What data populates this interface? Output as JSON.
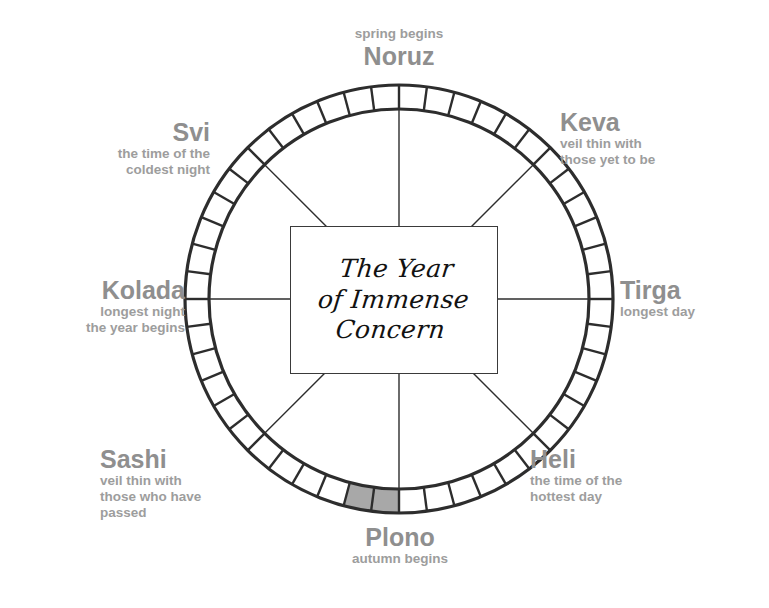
{
  "center": {
    "title": "The Year\nof Immense\nConcern"
  },
  "wheel": {
    "cell_count": 48,
    "spoke_count": 8,
    "highlighted_cells": [
      24,
      25
    ],
    "colors": {
      "line": "#2d2d2d",
      "highlight": "#a8a8a8",
      "cell_fill": "#ffffff",
      "background": "#ffffff"
    },
    "geometry": {
      "center_x": 399,
      "center_y": 299,
      "outer_radius": 214,
      "inner_radius": 190
    }
  },
  "stations": [
    {
      "id": "noruz",
      "name": "Noruz",
      "description": "spring begins",
      "position": "top",
      "align": "center",
      "order": "desc-first"
    },
    {
      "id": "keva",
      "name": "Keva",
      "description": "veil thin with\nthose yet to be",
      "position": "upper-right",
      "align": "left",
      "order": "name-first"
    },
    {
      "id": "tirga",
      "name": "Tirga",
      "description": "longest day",
      "position": "right",
      "align": "left",
      "order": "name-first"
    },
    {
      "id": "heli",
      "name": "Heli",
      "description": "the time of the\nhottest day",
      "position": "lower-right",
      "align": "left",
      "order": "name-first"
    },
    {
      "id": "plono",
      "name": "Plono",
      "description": "autumn begins",
      "position": "bottom",
      "align": "center",
      "order": "name-first"
    },
    {
      "id": "sashi",
      "name": "Sashi",
      "description": "veil thin with\nthose who have\npassed",
      "position": "lower-left",
      "align": "left",
      "order": "name-first"
    },
    {
      "id": "kolada",
      "name": "Kolada",
      "description": "longest night\nthe year begins",
      "position": "left",
      "align": "right",
      "order": "name-first"
    },
    {
      "id": "svi",
      "name": "Svi",
      "description": "the time of the\ncoldest night",
      "position": "upper-left",
      "align": "right",
      "order": "name-first"
    }
  ]
}
